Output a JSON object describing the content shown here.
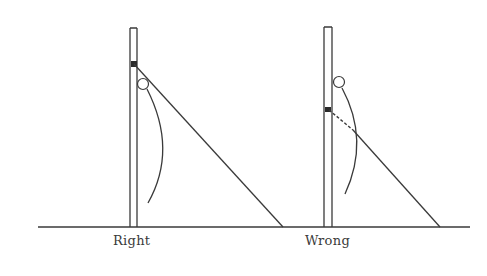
{
  "diagram": {
    "type": "comparison illustration",
    "stroke_color": "#3a3a3a",
    "background": "#ffffff",
    "ground_line": {
      "x1": 38,
      "x2": 470,
      "y": 227
    },
    "panels": [
      {
        "label": "Right",
        "label_pos": {
          "x": 113,
          "y": 234
        },
        "pole": {
          "x_left": 130,
          "x_right": 137,
          "top": 28,
          "bottom": 227
        },
        "guy_wire": {
          "x1": 134,
          "y1": 64,
          "x2": 283,
          "y2": 227,
          "dashed_segment": null
        },
        "ring": {
          "cx": 143,
          "cy": 84,
          "r": 5.5
        },
        "curve": "M147,89 Q178,150 148,203"
      },
      {
        "label": "Wrong",
        "label_pos": {
          "x": 305,
          "y": 234
        },
        "pole": {
          "x_left": 324,
          "x_right": 332,
          "top": 27,
          "bottom": 227
        },
        "guy_wire": {
          "x1": 329,
          "y1": 110,
          "x2": 440,
          "y2": 227,
          "dashed_segment": {
            "x1": 329,
            "y1": 110,
            "x2": 353,
            "y2": 130
          }
        },
        "ring": {
          "cx": 339,
          "cy": 82,
          "r": 5.5
        },
        "curve": "M342,88 Q370,140 345,194"
      }
    ]
  }
}
